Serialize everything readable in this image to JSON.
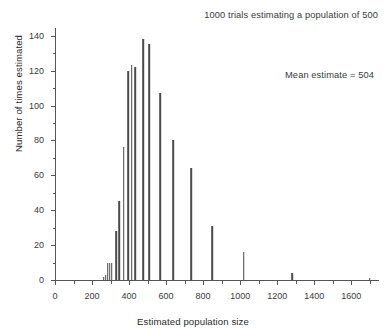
{
  "chart_data": {
    "type": "bar",
    "title": "1000 trials estimating a population of 500",
    "xlabel": "Estimated population size",
    "ylabel": "Number of times estimated",
    "xlim": [
      0,
      1750
    ],
    "ylim": [
      0,
      145
    ],
    "grid": false,
    "legend": null,
    "annotations": [
      {
        "text": "Mean estimate = 504",
        "position": "upper-right"
      }
    ],
    "xticks": [
      0,
      200,
      400,
      600,
      800,
      1000,
      1200,
      1400,
      1600
    ],
    "xtick_labels": [
      "0",
      "200",
      "400",
      "600",
      "800",
      "1000",
      "1200",
      "1400",
      "1600"
    ],
    "xticks_minor": [
      100,
      300,
      500,
      700,
      900,
      1100,
      1300,
      1500,
      1700
    ],
    "yticks": [
      0,
      20,
      40,
      60,
      80,
      100,
      120,
      140
    ],
    "ytick_labels": [
      "0",
      "20",
      "40",
      "60",
      "80",
      "100",
      "120",
      "140"
    ],
    "yticks_minor": [
      10,
      30,
      50,
      70,
      90,
      110,
      130
    ],
    "bar_color": "#4a4a4a",
    "axis_color": "#555555",
    "background_color": "#ffffff",
    "x": [
      265,
      280,
      295,
      310,
      325,
      345,
      365,
      385,
      405,
      425,
      445,
      465,
      485,
      505,
      525,
      545,
      570,
      600,
      640,
      690,
      735,
      790,
      850,
      935,
      1020,
      1150,
      1280,
      1480,
      1700
    ],
    "values": [
      2,
      3,
      10,
      10,
      10,
      28,
      45,
      76,
      120,
      123,
      122,
      138,
      135,
      107,
      107,
      80,
      80,
      64,
      80,
      31,
      64,
      16,
      31,
      4,
      16,
      1,
      4,
      1,
      1
    ],
    "points": [
      {
        "x": 265,
        "y": 2
      },
      {
        "x": 280,
        "y": 3
      },
      {
        "x": 295,
        "y": 10
      },
      {
        "x": 308,
        "y": 10
      },
      {
        "x": 322,
        "y": 28
      },
      {
        "x": 337,
        "y": 45
      },
      {
        "x": 352,
        "y": 76
      },
      {
        "x": 368,
        "y": 120
      },
      {
        "x": 383,
        "y": 123
      },
      {
        "x": 398,
        "y": 122
      },
      {
        "x": 420,
        "y": 138
      },
      {
        "x": 440,
        "y": 135
      },
      {
        "x": 470,
        "y": 107
      },
      {
        "x": 500,
        "y": 80
      },
      {
        "x": 530,
        "y": 64
      },
      {
        "x": 575,
        "y": 31
      },
      {
        "x": 640,
        "y": 16
      },
      {
        "x": 735,
        "y": 4
      },
      {
        "x": 850,
        "y": 1
      }
    ],
    "series": [
      {
        "name": "Estimated population frequency",
        "bars": [
          {
            "x": 263,
            "height": 2
          },
          {
            "x": 274,
            "height": 3
          },
          {
            "x": 285,
            "height": 10
          },
          {
            "x": 296,
            "height": 10
          },
          {
            "x": 307,
            "height": 10
          },
          {
            "x": 330,
            "height": 28
          },
          {
            "x": 348,
            "height": 45
          },
          {
            "x": 370,
            "height": 76
          },
          {
            "x": 395,
            "height": 120
          },
          {
            "x": 414,
            "height": 123
          },
          {
            "x": 433,
            "height": 122
          },
          {
            "x": 478,
            "height": 138
          },
          {
            "x": 510,
            "height": 135
          },
          {
            "x": 568,
            "height": 107
          },
          {
            "x": 640,
            "height": 80
          },
          {
            "x": 735,
            "height": 64
          },
          {
            "x": 850,
            "height": 31
          },
          {
            "x": 1020,
            "height": 16
          },
          {
            "x": 1280,
            "height": 4
          },
          {
            "x": 1700,
            "height": 1
          }
        ]
      }
    ],
    "summary_statistics": {
      "trials": 1000,
      "true_population": 500,
      "mean_estimate": 504
    }
  }
}
